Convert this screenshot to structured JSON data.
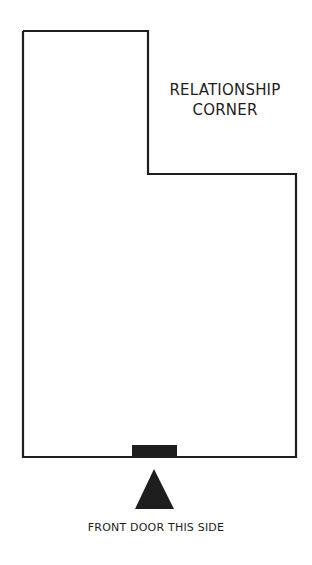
{
  "diagram": {
    "title_line1": "RELATIONSHIP",
    "title_line2": "CORNER",
    "door_caption": "FRONT DOOR THIS SIDE",
    "colors": {
      "stroke": "#1e1e1e",
      "background": "#ffffff"
    }
  }
}
